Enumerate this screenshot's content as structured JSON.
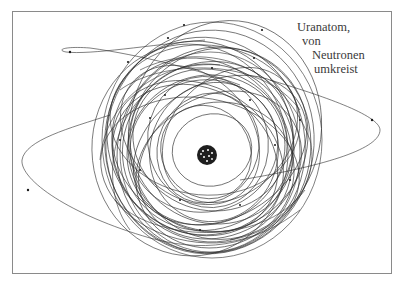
{
  "figure": {
    "caption_lines": [
      "Uranatom,",
      "von",
      "Neutronen",
      "umkreist"
    ],
    "colors": {
      "background": "#ffffff",
      "frame": "#8a8a8a",
      "orbit_line": "#2b2b2b",
      "nucleus": "#1a1a1a",
      "caption_text": "#3a3a3a"
    }
  }
}
